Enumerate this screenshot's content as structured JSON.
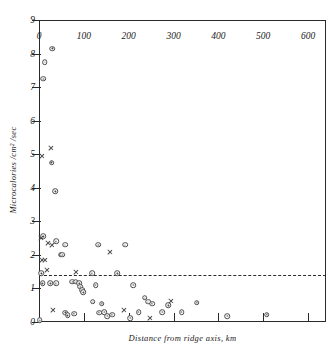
{
  "chart_data": {
    "type": "scatter",
    "title": "",
    "xlabel": "Distance from ridge axis, km",
    "ylabel": "Microcalories /cm² /sec",
    "xlim": [
      0,
      640
    ],
    "ylim": [
      0,
      9
    ],
    "xticks": [
      0,
      100,
      200,
      300,
      400,
      500,
      600
    ],
    "xticklabels": [
      "0",
      "100",
      "200",
      "300",
      "400",
      "500",
      "600"
    ],
    "yticks": [
      0,
      1,
      2,
      3,
      4,
      5,
      6,
      7,
      8,
      9
    ],
    "yticklabels": [
      "0",
      "1",
      "2",
      "3",
      "4",
      "5",
      "6",
      "7",
      "8",
      "9"
    ],
    "grid": false,
    "legend": "none",
    "annotations": [
      {
        "name": "reference-dashed-line",
        "type": "hline",
        "y": 1.4,
        "style": "dashed"
      }
    ],
    "series": [
      {
        "name": "circle-markers",
        "marker": "circle-dot",
        "points": [
          [
            30,
            8.15
          ],
          [
            13,
            7.75
          ],
          [
            10,
            7.25
          ],
          [
            28,
            4.75
          ],
          [
            36,
            3.9
          ],
          [
            10,
            2.55
          ],
          [
            38,
            2.4
          ],
          [
            58,
            2.3
          ],
          [
            132,
            2.3
          ],
          [
            192,
            2.3
          ],
          [
            48,
            2.0
          ],
          [
            52,
            2.0
          ],
          [
            5,
            1.45
          ],
          [
            118,
            1.45
          ],
          [
            175,
            1.45
          ],
          [
            8,
            1.15
          ],
          [
            25,
            1.15
          ],
          [
            38,
            1.15
          ],
          [
            74,
            1.2
          ],
          [
            82,
            1.2
          ],
          [
            90,
            1.15
          ],
          [
            92,
            1.05
          ],
          [
            126,
            1.1
          ],
          [
            210,
            1.1
          ],
          [
            96,
            0.95
          ],
          [
            99,
            0.88
          ],
          [
            120,
            0.6
          ],
          [
            140,
            0.55
          ],
          [
            236,
            0.72
          ],
          [
            243,
            0.6
          ],
          [
            252,
            0.55
          ],
          [
            288,
            0.5
          ],
          [
            352,
            0.58
          ],
          [
            59,
            0.28
          ],
          [
            64,
            0.2
          ],
          [
            78,
            0.25
          ],
          [
            134,
            0.28
          ],
          [
            146,
            0.3
          ],
          [
            152,
            0.18
          ],
          [
            163,
            0.22
          ],
          [
            204,
            0.12
          ],
          [
            222,
            0.3
          ],
          [
            275,
            0.3
          ],
          [
            318,
            0.3
          ],
          [
            420,
            0.18
          ],
          [
            508,
            0.22
          ],
          [
            2,
            0.05
          ]
        ]
      },
      {
        "name": "cross-markers",
        "marker": "x",
        "points": [
          [
            6,
            4.95
          ],
          [
            26,
            5.2
          ],
          [
            4,
            2.5
          ],
          [
            20,
            2.35
          ],
          [
            30,
            2.3
          ],
          [
            6,
            1.85
          ],
          [
            14,
            1.85
          ],
          [
            158,
            2.1
          ],
          [
            18,
            1.55
          ],
          [
            82,
            1.5
          ],
          [
            32,
            0.35
          ],
          [
            190,
            0.35
          ],
          [
            248,
            0.12
          ],
          [
            295,
            0.62
          ]
        ]
      }
    ]
  },
  "axis": {
    "x_title": "Distance from ridge axis, km",
    "y_title": "Microcalories /cm² /sec"
  }
}
